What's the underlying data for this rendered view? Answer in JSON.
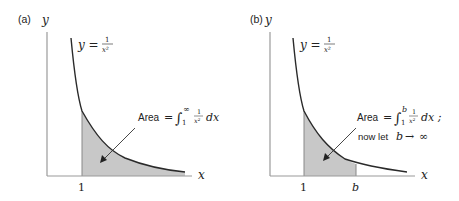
{
  "figure": {
    "panels": [
      {
        "id": "a",
        "label": "(a)",
        "y_axis_label": "y",
        "x_axis_label": "x",
        "curve_label": {
          "lhs": "y =",
          "num": "1",
          "den": "x²"
        },
        "tick_labels": [
          "1"
        ],
        "annotation": {
          "prefix": "Area",
          "eq": "=",
          "integral": "∫",
          "upper": "∞",
          "lower": "1",
          "frac_num": "1",
          "frac_den": "x²",
          "dx": "dx"
        }
      },
      {
        "id": "b",
        "label": "(b)",
        "y_axis_label": "y",
        "x_axis_label": "x",
        "curve_label": {
          "lhs": "y =",
          "num": "1",
          "den": "x²"
        },
        "tick_labels": [
          "1",
          "b"
        ],
        "annotation": {
          "prefix": "Area",
          "eq": "=",
          "integral": "∫",
          "upper": "b",
          "lower": "1",
          "frac_num": "1",
          "frac_den": "x²",
          "dx": "dx ;",
          "line2_prefix": "now let",
          "line2_var": "b",
          "line2_arrow": "→",
          "line2_limit": "∞"
        }
      }
    ],
    "colors": {
      "axis": "#9a9a9a",
      "curve": "#2a2a2a",
      "shade": "#c8c8c8",
      "text": "#222222"
    }
  }
}
